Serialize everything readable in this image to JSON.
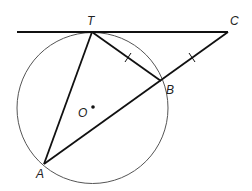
{
  "figure": {
    "width": 252,
    "height": 191,
    "colors": {
      "line": "#111111",
      "circle": "#555555",
      "label": "#222222",
      "background": "#ffffff"
    },
    "circle": {
      "name": "circle-O",
      "cx": 92.5,
      "cy": 108,
      "r": 75.5
    },
    "points": {
      "T": {
        "label": "T",
        "x": 92,
        "y": 32,
        "lx": 87,
        "ly": 25
      },
      "C": {
        "label": "C",
        "x": 228,
        "y": 32,
        "lx": 230,
        "ly": 25
      },
      "B": {
        "label": "B",
        "x": 161,
        "y": 81,
        "lx": 166,
        "ly": 94
      },
      "A": {
        "label": "A",
        "x": 44,
        "y": 164,
        "lx": 36,
        "ly": 178
      },
      "O": {
        "label": "O",
        "x": 93,
        "y": 107,
        "lx": 78,
        "ly": 117
      }
    },
    "segments": [
      {
        "name": "tangent-line-TC",
        "x1": 17,
        "y1": 32,
        "x2": 228,
        "y2": 32
      },
      {
        "name": "segment-TA",
        "x1": 92,
        "y1": 32,
        "x2": 44,
        "y2": 164
      },
      {
        "name": "segment-TB",
        "x1": 92,
        "y1": 32,
        "x2": 161,
        "y2": 81
      },
      {
        "name": "secant-AC",
        "x1": 44,
        "y1": 164,
        "x2": 228,
        "y2": 32
      }
    ],
    "tick_marks": [
      {
        "name": "tick-TB",
        "x1": 125,
        "y1": 62,
        "x2": 131,
        "y2": 53
      },
      {
        "name": "tick-BC",
        "x1": 189,
        "y1": 53,
        "x2": 195,
        "y2": 62
      }
    ]
  }
}
